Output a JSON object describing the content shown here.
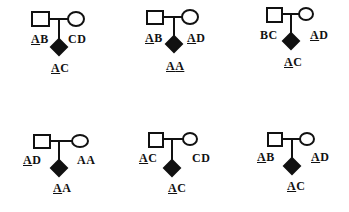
{
  "diagram": {
    "type": "pedigree-genotypes",
    "panels": [
      {
        "id": 1,
        "father": {
          "a1": "A",
          "a1_underlined": true,
          "a2": "B",
          "a2_underlined": false
        },
        "mother": {
          "a1": "C",
          "a1_underlined": false,
          "a2": "D",
          "a2_underlined": false
        },
        "child": {
          "a1": "A",
          "a1_underlined": true,
          "a2": "C",
          "a2_underlined": false
        }
      },
      {
        "id": 2,
        "father": {
          "a1": "A",
          "a1_underlined": true,
          "a2": "B",
          "a2_underlined": false
        },
        "mother": {
          "a1": "A",
          "a1_underlined": true,
          "a2": "D",
          "a2_underlined": false
        },
        "child": {
          "a1": "A",
          "a1_underlined": true,
          "a2": "A",
          "a2_underlined": true
        }
      },
      {
        "id": 3,
        "father": {
          "a1": "B",
          "a1_underlined": false,
          "a2": "C",
          "a2_underlined": false
        },
        "mother": {
          "a1": "A",
          "a1_underlined": true,
          "a2": "D",
          "a2_underlined": false
        },
        "child": {
          "a1": "A",
          "a1_underlined": true,
          "a2": "C",
          "a2_underlined": false
        }
      },
      {
        "id": 4,
        "father": {
          "a1": "A",
          "a1_underlined": true,
          "a2": "D",
          "a2_underlined": false
        },
        "mother": {
          "a1": "A",
          "a1_underlined": false,
          "a2": "A",
          "a2_underlined": false
        },
        "child": {
          "a1": "A",
          "a1_underlined": true,
          "a2": "A",
          "a2_underlined": false
        }
      },
      {
        "id": 5,
        "father": {
          "a1": "A",
          "a1_underlined": true,
          "a2": "C",
          "a2_underlined": false
        },
        "mother": {
          "a1": "C",
          "a1_underlined": false,
          "a2": "D",
          "a2_underlined": false
        },
        "child": {
          "a1": "A",
          "a1_underlined": true,
          "a2": "C",
          "a2_underlined": false
        }
      },
      {
        "id": 6,
        "father": {
          "a1": "A",
          "a1_underlined": true,
          "a2": "B",
          "a2_underlined": false
        },
        "mother": {
          "a1": "A",
          "a1_underlined": true,
          "a2": "D",
          "a2_underlined": false
        },
        "child": {
          "a1": "A",
          "a1_underlined": true,
          "a2": "C",
          "a2_underlined": false
        }
      }
    ],
    "colors": {
      "stroke": "#111111",
      "affected_fill": "#111111",
      "background": "#ffffff"
    }
  }
}
